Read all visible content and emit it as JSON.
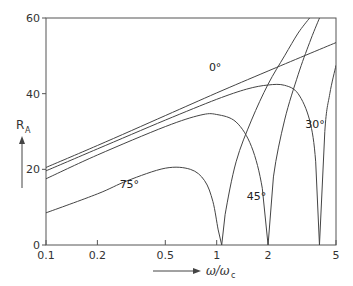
{
  "chart_data": {
    "type": "line",
    "title": "",
    "xlabel": "ω/ω_c",
    "ylabel": "R_A",
    "xscale": "log",
    "xlim": [
      0.1,
      5
    ],
    "ylim": [
      0,
      60
    ],
    "x_ticks": [
      0.1,
      0.2,
      0.5,
      1,
      2,
      5
    ],
    "x_tick_labels": [
      "0.1",
      "0.2",
      "0.5",
      "1",
      "2",
      "5"
    ],
    "y_ticks": [
      0,
      20,
      40,
      60
    ],
    "y_tick_labels": [
      "0",
      "20",
      "40",
      "60"
    ],
    "grid": false,
    "legend": "none (curves labeled inline)",
    "series": [
      {
        "name": "0°",
        "label": "0°",
        "label_pos": [
          0.9,
          46
        ],
        "x": [
          0.1,
          0.2,
          0.5,
          1,
          2,
          5
        ],
        "y": [
          20.5,
          26.3,
          34.2,
          40.2,
          46.0,
          53.5
        ]
      },
      {
        "name": "30°",
        "label": "30°",
        "label_pos": [
          3.3,
          31
        ],
        "x": [
          0.1,
          0.2,
          0.5,
          1,
          1.5,
          2,
          2.5,
          3,
          3.5,
          3.8,
          4.0,
          4.3,
          4.6,
          5
        ],
        "y": [
          19.6,
          25.4,
          33.0,
          38.5,
          41.2,
          42.3,
          42.2,
          40.0,
          33.0,
          22.0,
          0,
          30.0,
          40.0,
          47.5
        ]
      },
      {
        "name": "45°",
        "label": "45°",
        "label_pos": [
          1.5,
          12
        ],
        "x": [
          0.1,
          0.2,
          0.5,
          0.8,
          1,
          1.3,
          1.6,
          1.85,
          2.0,
          2.15,
          2.5,
          3,
          3.5,
          4.0
        ],
        "y": [
          17.5,
          23.8,
          31.3,
          34.3,
          34.5,
          32.5,
          26.0,
          15.0,
          0,
          18.0,
          33.0,
          45.0,
          53.5,
          60
        ]
      },
      {
        "name": "75°",
        "label": "75°",
        "label_pos": [
          0.27,
          15
        ],
        "x": [
          0.1,
          0.2,
          0.3,
          0.5,
          0.7,
          0.85,
          0.95,
          1.02,
          1.07,
          1.12,
          1.3,
          1.6,
          2.0,
          2.5,
          3.0,
          3.5
        ],
        "y": [
          8.5,
          13.5,
          17.0,
          20.3,
          20.0,
          17.0,
          11.5,
          4.0,
          0,
          8.0,
          22.0,
          33.0,
          42.5,
          50.0,
          56.0,
          60
        ]
      }
    ],
    "annotations": [
      "arrow along y-axis label R_A",
      "arrow along x-axis label ω/ω_c"
    ]
  },
  "axes": {
    "y_label": "R",
    "y_label_sub": "A",
    "x_label": "ω/ω",
    "x_label_sub": "c"
  },
  "colors": {
    "line": "#444444",
    "axis": "#555555",
    "text": "#333333",
    "background": "#ffffff"
  }
}
